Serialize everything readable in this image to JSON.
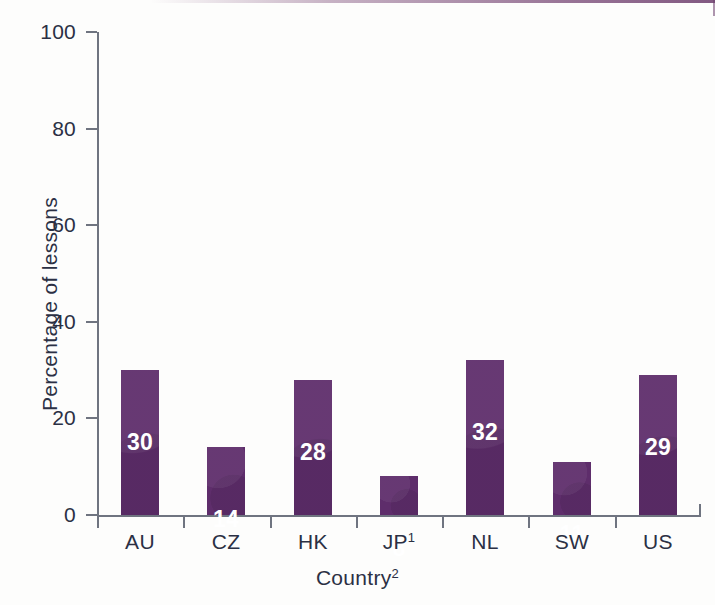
{
  "chart_data": {
    "type": "bar",
    "title": "",
    "categories": [
      "AU",
      "CZ",
      "HK",
      "JP1",
      "NL",
      "SW",
      "US"
    ],
    "category_labels_html": [
      "AU",
      "CZ",
      "HK",
      "JP<sup>1</sup>",
      "NL",
      "SW",
      "US"
    ],
    "values": [
      30,
      14,
      28,
      8,
      32,
      11,
      29
    ],
    "value_labels": [
      "30",
      "14",
      "28",
      "8",
      "32",
      "11",
      "29"
    ],
    "xlabel": "Country2",
    "xlabel_html": "Country<sup>2</sup>",
    "ylabel": "Percentage of lessons",
    "ylim": [
      0,
      100
    ],
    "yticks": [
      0,
      20,
      40,
      60,
      80,
      100
    ],
    "ytick_labels": [
      "0",
      "20",
      "40",
      "60",
      "80",
      "100"
    ],
    "grid": false,
    "legend": false,
    "bar_color": "#5e2d6b",
    "value_label_color": "#ffffff",
    "axis_color": "#6f7480",
    "text_color": "#2b3044",
    "background_color": "#fdfdfc"
  }
}
